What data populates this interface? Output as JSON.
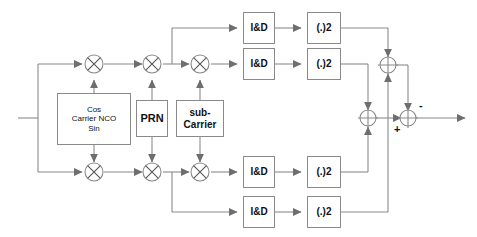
{
  "diagram": {
    "colors": {
      "line": "#8a8a8a",
      "arrow": "#6e6e6e",
      "box_border": "#8a8a8a",
      "text": "#111111",
      "background": "#ffffff"
    },
    "blocks": {
      "carrier_nco": {
        "line1": "Cos",
        "line2": "Carrier NCO",
        "line3": "Sin"
      },
      "prn": {
        "label": "PRN"
      },
      "sub_carrier": {
        "line1": "sub-",
        "line2": "Carrier"
      },
      "integrators": [
        {
          "label": "I&D"
        },
        {
          "label": "I&D"
        },
        {
          "label": "I&D"
        },
        {
          "label": "I&D"
        }
      ],
      "squarers": [
        {
          "label": "(.)2"
        },
        {
          "label": "(.)2"
        },
        {
          "label": "(.)2"
        },
        {
          "label": "(.)2"
        }
      ]
    },
    "multipliers": [
      {
        "name": "carrier-mixer-upper",
        "symbol": "X"
      },
      {
        "name": "carrier-mixer-lower",
        "symbol": "X"
      },
      {
        "name": "prn-mixer-upper",
        "symbol": "X"
      },
      {
        "name": "prn-mixer-lower",
        "symbol": "X"
      },
      {
        "name": "subcarrier-mixer-upper",
        "symbol": "X"
      },
      {
        "name": "subcarrier-mixer-lower",
        "symbol": "X"
      }
    ],
    "adders": [
      {
        "name": "adder-upper",
        "signs": []
      },
      {
        "name": "adder-middle",
        "signs": []
      },
      {
        "name": "adder-output",
        "signs": [
          "-",
          "+"
        ]
      }
    ],
    "signs": {
      "minus": "-",
      "plus": "+"
    }
  }
}
